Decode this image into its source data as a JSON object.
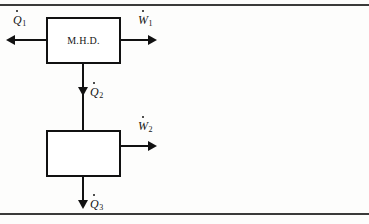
{
  "figure": {
    "frame": {
      "top_rule": "horizontal-rule",
      "bottom_rule": "horizontal-rule",
      "color": "#3a3a3a"
    },
    "line_color": "#111111",
    "background": "#fdfdfc"
  },
  "blocks": [
    {
      "id": "mhd",
      "label": "M.H.D."
    },
    {
      "id": "lower",
      "label": ""
    }
  ],
  "flows": [
    {
      "id": "q1",
      "symbol": "Q",
      "subscript": "1",
      "dot": true,
      "direction": "left",
      "kind": "heat-input"
    },
    {
      "id": "w1",
      "symbol": "W",
      "subscript": "1",
      "dot": true,
      "direction": "right",
      "kind": "work-output"
    },
    {
      "id": "q2",
      "symbol": "Q",
      "subscript": "2",
      "dot": true,
      "direction": "down",
      "kind": "heat-transfer"
    },
    {
      "id": "w2",
      "symbol": "W",
      "subscript": "2",
      "dot": true,
      "direction": "right",
      "kind": "work-output"
    },
    {
      "id": "q3",
      "symbol": "Q",
      "subscript": "3",
      "dot": true,
      "direction": "down",
      "kind": "heat-rejection"
    }
  ]
}
